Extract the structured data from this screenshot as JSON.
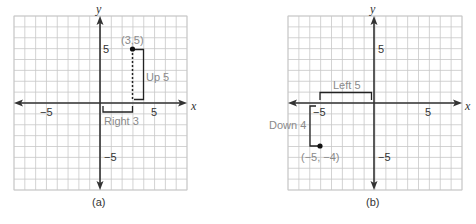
{
  "chart_data": [
    {
      "type": "scatter",
      "panel": "(a)",
      "xlabel": "x",
      "ylabel": "y",
      "xlim": [
        -8,
        8
      ],
      "ylim": [
        -8,
        8
      ],
      "grid": true,
      "x_tick_labels": [
        "-5",
        "5"
      ],
      "y_tick_labels": [
        "5",
        "-5"
      ],
      "points": [
        {
          "x": 3,
          "y": 5,
          "label": "(3,5)"
        }
      ],
      "annotations": [
        {
          "text": "Right 3",
          "from": [
            0,
            0
          ],
          "to": [
            3,
            0
          ]
        },
        {
          "text": "Up 5",
          "from": [
            3,
            0
          ],
          "to": [
            3,
            5
          ]
        }
      ]
    },
    {
      "type": "scatter",
      "panel": "(b)",
      "xlabel": "x",
      "ylabel": "y",
      "xlim": [
        -8,
        8
      ],
      "ylim": [
        -8,
        8
      ],
      "grid": true,
      "x_tick_labels": [
        "-5",
        "5"
      ],
      "y_tick_labels": [
        "5",
        "-5"
      ],
      "points": [
        {
          "x": -5,
          "y": -4,
          "label": "(−5, −4)"
        }
      ],
      "annotations": [
        {
          "text": "Left 5",
          "from": [
            0,
            0
          ],
          "to": [
            -5,
            0
          ]
        },
        {
          "text": "Down 4",
          "from": [
            -5,
            0
          ],
          "to": [
            -5,
            -4
          ]
        }
      ]
    }
  ],
  "panels": {
    "a": {
      "caption": "(a)",
      "x_axis_label": "x",
      "y_axis_label": "y",
      "tick_x_neg": "−5",
      "tick_x_pos": "5",
      "tick_y_pos": "5",
      "tick_y_neg": "−5",
      "point_label": "(3,5)",
      "horizontal_move": "Right 3",
      "vertical_move": "Up 5"
    },
    "b": {
      "caption": "(b)",
      "x_axis_label": "x",
      "y_axis_label": "y",
      "tick_x_neg": "−5",
      "tick_x_pos": "5",
      "tick_y_pos": "5",
      "tick_y_neg": "−5",
      "point_label": "(−5, −4)",
      "horizontal_move": "Left 5",
      "vertical_move": "Down 4"
    }
  }
}
